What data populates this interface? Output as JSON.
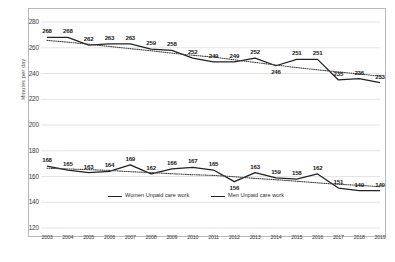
{
  "chart_data": {
    "type": "line",
    "title": "",
    "xlabel": "",
    "ylabel": "Minutes per day",
    "categories": [
      "2003",
      "2004",
      "2005",
      "2006",
      "2007",
      "2008",
      "2009",
      "2010",
      "2011",
      "2012",
      "2013",
      "2014",
      "2015",
      "2016",
      "2017",
      "2018",
      "2019"
    ],
    "ylim": [
      120,
      280
    ],
    "yticks": [
      120,
      140,
      160,
      180,
      200,
      220,
      240,
      260,
      280
    ],
    "grid": true,
    "legend_position": "inside-bottom-center",
    "series": [
      {
        "name": "Women Unpaid care work",
        "style": "solid",
        "values": [
          268,
          268,
          262,
          263,
          263,
          259,
          258,
          252,
          249,
          249,
          252,
          246,
          251,
          251,
          235,
          236,
          233
        ],
        "trendline": "dotted"
      },
      {
        "name": "Men Unpaid care work",
        "style": "solid",
        "values": [
          168,
          165,
          163,
          164,
          169,
          162,
          166,
          167,
          165,
          156,
          163,
          159,
          158,
          162,
          151,
          149,
          149
        ],
        "trendline": "dotted"
      }
    ]
  },
  "axis": {
    "y_title": "Minutes per day",
    "y_ticks": [
      "280",
      "260",
      "240",
      "220",
      "200",
      "180",
      "160",
      "140",
      "120"
    ],
    "x_ticks": [
      "2003",
      "2004",
      "2005",
      "2006",
      "2007",
      "2008",
      "2009",
      "2010",
      "2011",
      "2012",
      "2013",
      "2014",
      "2015",
      "2016",
      "2017",
      "2018",
      "2019"
    ]
  },
  "labels": {
    "women": [
      "268",
      "268",
      "262",
      "263",
      "263",
      "259",
      "258",
      "252",
      "249",
      "249",
      "252",
      "246",
      "251",
      "251",
      "235",
      "236",
      "233"
    ],
    "men": [
      "168",
      "165",
      "163",
      "164",
      "169",
      "162",
      "166",
      "167",
      "165",
      "156",
      "163",
      "159",
      "158",
      "162",
      "151",
      "149",
      "149"
    ]
  },
  "legend": {
    "women_label": "Women Unpaid care work",
    "men_label": "Men Unpaid care work"
  },
  "colors": {
    "line": "#222222",
    "grid": "#d8d8d8",
    "frame": "#b9b9b9",
    "text": "#2b2b2b"
  }
}
